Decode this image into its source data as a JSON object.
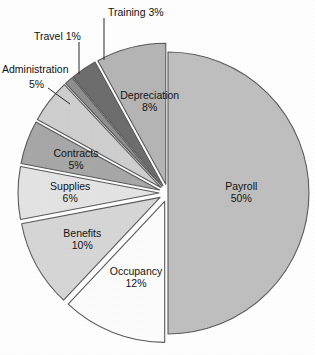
{
  "chart_data": {
    "type": "pie",
    "title": "",
    "subtitle": "",
    "xlabel": "",
    "ylabel": "",
    "legend_position": "none",
    "grid": false,
    "value_unit": "percent",
    "total": 100,
    "categories": [
      "Payroll",
      "Occupancy",
      "Benefits",
      "Supplies",
      "Contracts",
      "Administration",
      "Travel",
      "Training",
      "Depreciation"
    ],
    "values": [
      50,
      12,
      10,
      6,
      5,
      5,
      1,
      3,
      8
    ],
    "slices": [
      {
        "name": "Payroll",
        "label": "Payroll",
        "percent_text": "50%",
        "value": 50,
        "color": "#bfbfbf",
        "exploded": false,
        "label_placement": "inside"
      },
      {
        "name": "Occupancy",
        "label": "Occupancy",
        "percent_text": "12%",
        "value": 12,
        "color": "#fdfdfd",
        "exploded": true,
        "label_placement": "inside"
      },
      {
        "name": "Benefits",
        "label": "Benefits",
        "percent_text": "10%",
        "value": 10,
        "color": "#d7d7d7",
        "exploded": true,
        "label_placement": "inside"
      },
      {
        "name": "Supplies",
        "label": "Supplies",
        "percent_text": "6%",
        "value": 6,
        "color": "#e4e4e4",
        "exploded": true,
        "label_placement": "inside"
      },
      {
        "name": "Contracts",
        "label": "Contracts",
        "percent_text": "5%",
        "value": 5,
        "color": "#a8a8a8",
        "exploded": true,
        "label_placement": "inside"
      },
      {
        "name": "Administration",
        "label": "Administration",
        "percent_text": "5%",
        "value": 5,
        "color": "#cfcfcf",
        "exploded": true,
        "label_placement": "callout"
      },
      {
        "name": "Travel",
        "label": "Travel",
        "percent_text": "1%",
        "value": 1,
        "color": "#8f8f8f",
        "exploded": true,
        "label_placement": "callout"
      },
      {
        "name": "Training",
        "label": "Training",
        "percent_text": "3%",
        "value": 3,
        "color": "#6e6e6e",
        "exploded": true,
        "label_placement": "callout"
      },
      {
        "name": "Depreciation",
        "label": "Depreciation",
        "percent_text": "8%",
        "value": 8,
        "color": "#b5b5b5",
        "exploded": true,
        "label_placement": "inside"
      }
    ],
    "callouts": [
      {
        "name": "Training",
        "text": "Training 3%",
        "x": 108,
        "y": 13,
        "anchor": "start",
        "line": [
          [
            104,
            18
          ],
          [
            104,
            60
          ]
        ]
      },
      {
        "name": "Travel",
        "text": "Travel 1%",
        "x": 34,
        "y": 37,
        "anchor": "start",
        "line": [
          [
            79,
            42
          ],
          [
            79,
            74
          ]
        ]
      },
      {
        "name": "Administration",
        "text": "Administration",
        "x": 2,
        "y": 70,
        "anchor": "start",
        "line": [
          [
            48,
            88
          ],
          [
            70,
            104
          ]
        ]
      },
      {
        "name": "AdministrationPct",
        "text": "5%",
        "x": 29,
        "y": 85,
        "anchor": "start",
        "line": null
      }
    ],
    "geometry": {
      "center_x": 168,
      "center_y": 193,
      "radius": 141,
      "explode_offset": 9,
      "start_angle_deg": -90
    },
    "background_color": "#ffffff",
    "stroke_color": "#5b5b5b"
  }
}
